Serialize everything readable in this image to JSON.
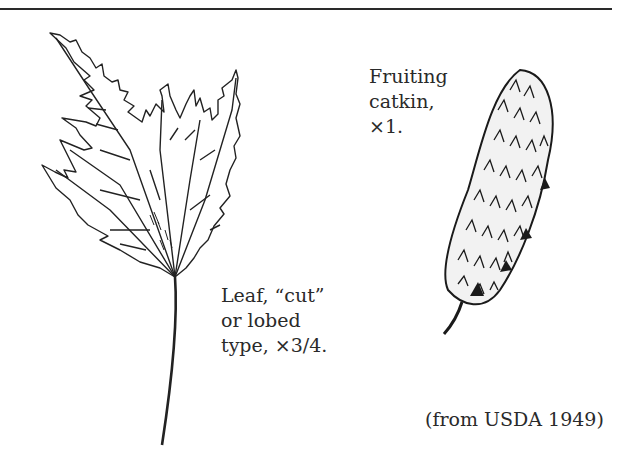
{
  "figure": {
    "captions": {
      "catkin": "Fruiting\ncatkin,\n×1.",
      "leaf": "Leaf, “cut”\nor lobed\ntype, ×3/4.",
      "source": "(from USDA 1949)"
    },
    "illustrations": [
      {
        "name": "leaf-illustration",
        "description": "Cut/lobed leaf with long petiole"
      },
      {
        "name": "catkin-illustration",
        "description": "Fruiting catkin with short stalk"
      }
    ],
    "colors": {
      "ink": "#222222",
      "background": "#ffffff"
    }
  }
}
